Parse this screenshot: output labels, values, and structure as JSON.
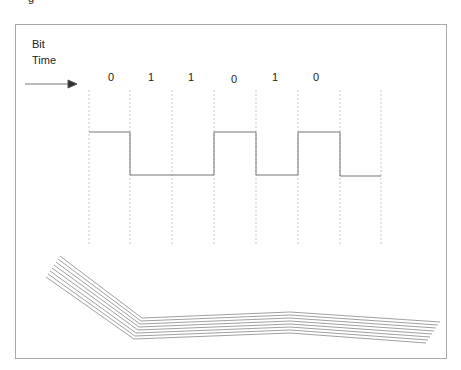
{
  "diagram": {
    "title_partial": "g",
    "axis_label_line1": "Bit",
    "axis_label_line2": "Time",
    "bits": [
      "0",
      "1",
      "1",
      "0",
      "1",
      "0"
    ],
    "signal_levels": [
      "high",
      "low",
      "low",
      "high",
      "low",
      "high",
      "low"
    ],
    "colors": {
      "line": "#777777",
      "grid": "#bbbbbb",
      "frame": "#aaaaaa"
    }
  }
}
